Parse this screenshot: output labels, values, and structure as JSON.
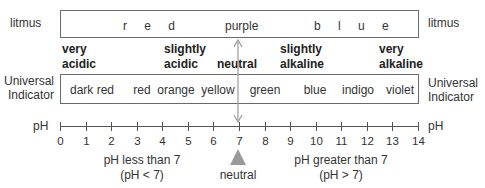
{
  "diagram": {
    "litmus": {
      "left_label": "litmus",
      "right_label": "litmus",
      "colors": [
        {
          "label": "r e d",
          "x": 182
        },
        {
          "label": "purple",
          "x": 222
        },
        {
          "label": "b l u e",
          "x": 310
        }
      ]
    },
    "categories": [
      {
        "line1": "very",
        "line2": "acidic",
        "x": 62
      },
      {
        "line1": "slightly",
        "line2": "acidic",
        "x": 164
      },
      {
        "line1": "",
        "line2": "neutral",
        "x": 216
      },
      {
        "line1": "slightly",
        "line2": "alkaline",
        "x": 280
      },
      {
        "line1": "very",
        "line2": "alkaline",
        "x": 380
      }
    ],
    "universal_indicator": {
      "left_label_1": "Universal",
      "left_label_2": "Indicator",
      "right_label_1": "Universal",
      "right_label_2": "Indicator",
      "colors": [
        {
          "label": "dark red",
          "x": 91
        },
        {
          "label": "red",
          "x": 140
        },
        {
          "label": "orange",
          "x": 175
        },
        {
          "label": "yellow",
          "x": 216
        },
        {
          "label": "green",
          "x": 263
        },
        {
          "label": "blue",
          "x": 313
        },
        {
          "label": "indigo",
          "x": 358
        },
        {
          "label": "violet",
          "x": 403
        }
      ]
    },
    "axis": {
      "left_label": "pH",
      "right_label": "pH",
      "min": 0,
      "max": 14,
      "ticks": [
        "0",
        "1",
        "2",
        "3",
        "4",
        "5",
        "6",
        "7",
        "8",
        "9",
        "10",
        "11",
        "12",
        "13",
        "14"
      ]
    },
    "annotations": {
      "acid_line1": "pH less than 7",
      "acid_line2": "(pH < 7)",
      "neutral": "neutral",
      "alkaline_line1": "pH greater than 7",
      "alkaline_line2": "(pH > 7)"
    },
    "colors": {
      "line": "#6a6a6a",
      "arrow": "#9a9a9a",
      "text": "#333333"
    }
  }
}
